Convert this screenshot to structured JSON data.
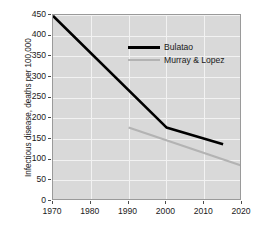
{
  "chart_data": {
    "type": "line",
    "title": "",
    "xlabel": "",
    "ylabel": "Infectious disease, deaths per 100,000",
    "xlim": [
      1970,
      2020
    ],
    "ylim": [
      0,
      450
    ],
    "xticks": [
      1970,
      1980,
      1990,
      2000,
      2010,
      2020
    ],
    "yticks": [
      0,
      50,
      100,
      150,
      200,
      250,
      300,
      350,
      400,
      450
    ],
    "grid": true,
    "legend_position": "upper-right-inside",
    "series": [
      {
        "name": "Bulatao",
        "color": "#000000",
        "x": [
          1970,
          2000,
          2015
        ],
        "values": [
          448,
          178,
          137
        ]
      },
      {
        "name": "Murray & Lopez",
        "color": "#b3b3b3",
        "x": [
          1990,
          2020
        ],
        "values": [
          178,
          85
        ]
      }
    ]
  },
  "axis": {
    "y_title": "Infectious disease, deaths per 100,000",
    "y_tick_labels": [
      "450",
      "400",
      "350",
      "300",
      "250",
      "200",
      "150",
      "100",
      "50",
      "0"
    ],
    "x_tick_labels": [
      "1970",
      "1980",
      "1990",
      "2000",
      "2010",
      "2020"
    ]
  },
  "legend": {
    "entries": [
      {
        "label": "Bulatao"
      },
      {
        "label": "Murray & Lopez"
      }
    ]
  }
}
